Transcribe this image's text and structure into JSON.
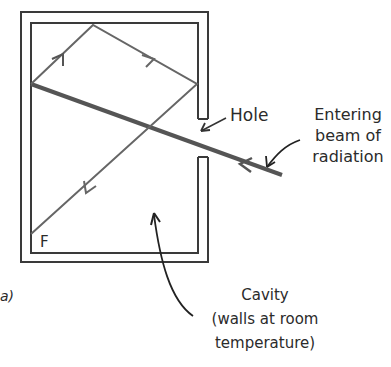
{
  "figure": {
    "panel_label": "a)",
    "corner_label": "F",
    "labels": {
      "hole": "Hole",
      "beam": [
        "Entering",
        "beam of",
        "radiation"
      ],
      "cavity": [
        "Cavity",
        "(walls at room",
        "temperature)"
      ]
    },
    "colors": {
      "wall": "#3a3a3a",
      "beam": "#555555",
      "ray": "#666666",
      "text": "#2b2b2b",
      "background": "#ffffff"
    }
  }
}
